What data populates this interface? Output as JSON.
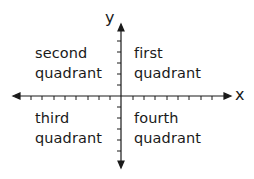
{
  "diagram": {
    "type": "coordinate-plane",
    "colors": {
      "ink": "#1a1a1a",
      "background": "#ffffff"
    },
    "axes": {
      "x_label": "x",
      "y_label": "y",
      "x_ticks_left": 8,
      "x_ticks_right": 8,
      "y_ticks_up": 5,
      "y_ticks_down": 5
    },
    "quadrants": {
      "first": {
        "line1": "first",
        "line2": "quadrant"
      },
      "second": {
        "line1": "second",
        "line2": "quadrant"
      },
      "third": {
        "line1": "third",
        "line2": "quadrant"
      },
      "fourth": {
        "line1": "fourth",
        "line2": "quadrant"
      }
    }
  }
}
